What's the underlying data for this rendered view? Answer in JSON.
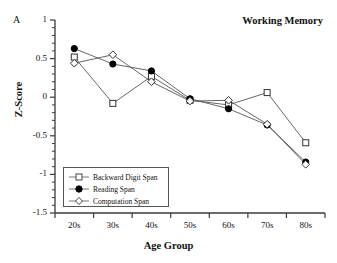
{
  "panel": {
    "label": "A"
  },
  "title": "Working Memory",
  "axes": {
    "xlabel": "Age Group",
    "ylabel": "Z-Score"
  },
  "chart_data": {
    "type": "line",
    "title": "Working Memory",
    "xlabel": "Age Group",
    "ylabel": "Z-Score",
    "categories": [
      "20s",
      "30s",
      "40s",
      "50s",
      "60s",
      "70s",
      "80s"
    ],
    "ylim": [
      -1.5,
      1.0
    ],
    "yticks": [
      1,
      0.5,
      0,
      -0.5,
      -1,
      -1.5
    ],
    "ytick_labels": [
      "1",
      "0.5",
      "0",
      "-0.5",
      "-1",
      "-1.5"
    ],
    "minor_tick_step": 0.1,
    "grid": false,
    "legend_position": "lower-left-inside",
    "series": [
      {
        "name": "Backward Digit Span",
        "marker": "open-square",
        "values": [
          0.52,
          -0.08,
          0.27,
          -0.04,
          -0.1,
          0.06,
          -0.59
        ]
      },
      {
        "name": "Reading Span",
        "marker": "filled-circle",
        "values": [
          0.63,
          0.43,
          0.34,
          -0.02,
          -0.15,
          -0.36,
          -0.84
        ]
      },
      {
        "name": "Computation Span",
        "marker": "open-diamond",
        "values": [
          0.44,
          0.55,
          0.2,
          -0.05,
          -0.04,
          -0.35,
          -0.87
        ]
      }
    ]
  },
  "colors": {
    "axis": "#3a3a3a",
    "line": "#555555",
    "marker_fill_open": "#ffffff",
    "marker_fill_closed": "#000000",
    "text": "#111111"
  }
}
